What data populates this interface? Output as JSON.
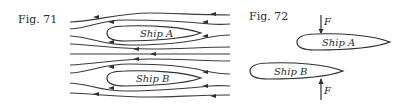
{
  "figure71": {
    "caption": "Fig. 71",
    "ship_a_label": "Ship A",
    "ship_b_label": "Ship B",
    "description": "Streamlines of flow past two parallel ships moving side by side"
  },
  "figure72": {
    "caption": "Fig. 72",
    "ship_a_label": "Ship A",
    "ship_b_label": "Ship B",
    "force_a_label": "F",
    "force_b_label": "F",
    "description": "Forces F pushing Ship A downward and Ship B upward toward each other"
  },
  "colors": {
    "ink": "#2f2f2f",
    "background": "#ffffff"
  }
}
